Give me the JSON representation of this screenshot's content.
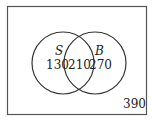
{
  "diagram": {
    "type": "venn",
    "sets": [
      {
        "name": "S",
        "only": "130"
      },
      {
        "name": "B",
        "only": "270"
      }
    ],
    "intersection": "210",
    "outside": "390"
  }
}
